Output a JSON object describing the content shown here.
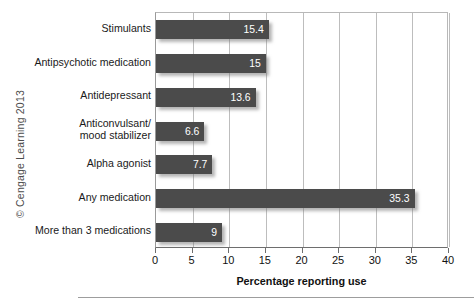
{
  "credit": {
    "text": "© Cengage Learning 2013"
  },
  "chart_data": {
    "type": "bar",
    "orientation": "horizontal",
    "title": "",
    "xlabel": "Percentage reporting use",
    "ylabel": "",
    "xlim": [
      0,
      40
    ],
    "xticks": [
      0,
      5,
      10,
      15,
      20,
      25,
      30,
      35,
      40
    ],
    "xtick_labels": [
      "0",
      "5",
      "10",
      "15",
      "20",
      "25",
      "30",
      "35",
      "40"
    ],
    "grid": "vertical",
    "legend": "none",
    "bar_color": "#4b4b4b",
    "value_label_color": "#ffffff",
    "categories": [
      "Stimulants",
      "Antipsychotic medication",
      "Antidepressant",
      "Anticonvulsant/\nmood stabilizer",
      "Alpha agonist",
      "Any medication",
      "More than 3 medications"
    ],
    "values": [
      15.4,
      15,
      13.6,
      6.6,
      7.7,
      35.3,
      9
    ],
    "value_labels": [
      "15.4",
      "15",
      "13.6",
      "6.6",
      "7.7",
      "35.3",
      "9"
    ]
  }
}
